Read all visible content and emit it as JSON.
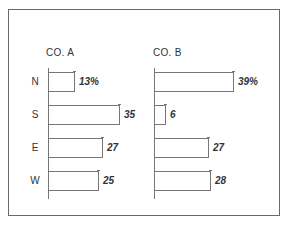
{
  "chart_data": {
    "type": "bar",
    "orientation": "horizontal",
    "title": "",
    "xlabel": "",
    "ylabel": "",
    "grid": false,
    "legend": null,
    "categories": [
      "N",
      "S",
      "E",
      "W"
    ],
    "panels": [
      {
        "name": "CO. A",
        "values": [
          13,
          35,
          27,
          25
        ],
        "labels": [
          "13%",
          "35",
          "27",
          "25"
        ]
      },
      {
        "name": "CO. B",
        "values": [
          39,
          6,
          27,
          28
        ],
        "labels": [
          "39%",
          "6",
          "27",
          "28"
        ]
      }
    ],
    "series": [
      {
        "name": "CO. A",
        "values": [
          13,
          35,
          27,
          25
        ]
      },
      {
        "name": "CO. B",
        "values": [
          39,
          6,
          27,
          28
        ]
      }
    ],
    "unit": "%",
    "xlim": [
      0,
      45
    ]
  },
  "colors": {
    "line": "#777777",
    "text": "#333333",
    "bar_fill": "#ffffff"
  }
}
